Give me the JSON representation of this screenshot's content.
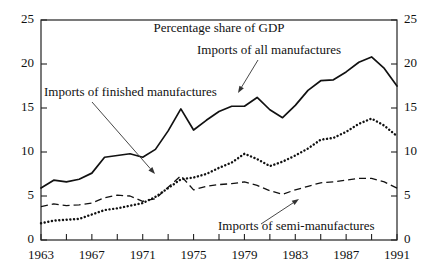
{
  "chart_data": {
    "type": "line",
    "title": "Percentage share of GDP",
    "xlabel": "",
    "ylabel": "",
    "xlim": [
      1963,
      1991
    ],
    "ylim": [
      0,
      25
    ],
    "grid": false,
    "legend_position": "inline-annotations",
    "y_ticks": [
      0,
      5,
      10,
      15,
      20,
      25
    ],
    "y_tick_labels": [
      "0",
      "5",
      "10",
      "15",
      "20",
      "25"
    ],
    "y_axis_right_mirrored": true,
    "x_ticks": [
      1963,
      1965,
      1967,
      1969,
      1971,
      1973,
      1975,
      1977,
      1979,
      1981,
      1983,
      1985,
      1987,
      1989,
      1991
    ],
    "x_tick_labels_shown": [
      "1963",
      "1967",
      "1971",
      "1975",
      "1979",
      "1983",
      "1987",
      "1991"
    ],
    "x": [
      1963,
      1964,
      1965,
      1966,
      1967,
      1968,
      1969,
      1970,
      1971,
      1972,
      1973,
      1974,
      1975,
      1976,
      1977,
      1978,
      1979,
      1980,
      1981,
      1982,
      1983,
      1984,
      1985,
      1986,
      1987,
      1988,
      1989,
      1990,
      1991
    ],
    "series": [
      {
        "name": "Imports of all manufactures",
        "style": "solid",
        "values": [
          5.9,
          6.8,
          6.6,
          6.9,
          7.6,
          9.4,
          9.6,
          9.8,
          9.4,
          10.3,
          12.4,
          14.9,
          12.5,
          13.6,
          14.6,
          15.2,
          15.2,
          16.2,
          14.8,
          13.9,
          15.3,
          17.0,
          18.1,
          18.2,
          19.1,
          20.2,
          20.8,
          19.5,
          17.5
        ]
      },
      {
        "name": "Imports of finished manufactures",
        "style": "dotted",
        "values": [
          1.9,
          2.2,
          2.3,
          2.4,
          2.9,
          3.4,
          3.6,
          3.9,
          4.2,
          4.9,
          5.9,
          6.9,
          7.1,
          7.5,
          8.2,
          8.8,
          9.8,
          9.2,
          8.4,
          8.9,
          9.6,
          10.4,
          11.4,
          11.6,
          12.3,
          13.2,
          13.8,
          13.0,
          11.8
        ]
      },
      {
        "name": "Imports of semi-manufactures",
        "style": "dashed",
        "values": [
          3.8,
          4.1,
          3.9,
          4.0,
          4.2,
          4.8,
          5.1,
          5.0,
          4.4,
          4.7,
          6.0,
          7.3,
          5.7,
          6.1,
          6.3,
          6.4,
          6.6,
          6.2,
          5.6,
          5.2,
          5.7,
          6.1,
          6.5,
          6.6,
          6.8,
          7.0,
          7.0,
          6.6,
          5.9
        ]
      }
    ],
    "annotations": [
      {
        "name": "imports-all-manufactures",
        "text": "Imports of all manufactures",
        "text_x": 197,
        "text_y": 54,
        "leader_from": [
          258,
          60
        ],
        "leader_to": [
          238,
          93
        ]
      },
      {
        "name": "imports-finished-manufactures",
        "text": "Imports of finished manufactures",
        "text_x": 44,
        "text_y": 96,
        "leader_from": [
          92,
          102
        ],
        "leader_to": [
          155,
          174
        ]
      },
      {
        "name": "imports-semi-manufactures",
        "text": "Imports of semi-manufactures",
        "text_x": 218,
        "text_y": 230,
        "leader_from": [
          261,
          224
        ],
        "leader_to": [
          299,
          199
        ]
      }
    ]
  }
}
